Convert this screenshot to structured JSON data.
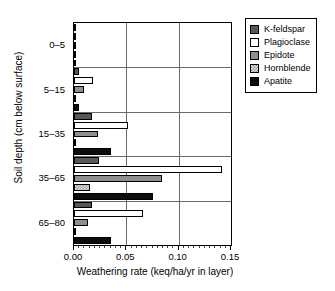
{
  "chart_data": {
    "type": "bar",
    "orientation": "horizontal",
    "title": "",
    "xlabel": "Weathering rate (keq/ha/yr in layer)",
    "ylabel": "Soil depth (cm below surface)",
    "xlim": [
      0.0,
      0.15
    ],
    "xticks": [
      0.0,
      0.05,
      0.1,
      0.15
    ],
    "xticklabels": [
      "0.00",
      "0.05",
      "0.10",
      "0.15"
    ],
    "categories": [
      "0–5",
      "5–15",
      "15–35",
      "35–65",
      "65–80"
    ],
    "grid": "vertical gridlines at 0.05 and 0.10; horizontal separators between depth groups",
    "legend_position": "upper right, outside axes",
    "series": [
      {
        "name": "K-feldspar",
        "color": "#585858",
        "values": [
          0.0015,
          0.0045,
          0.017,
          0.024,
          0.017
        ]
      },
      {
        "name": "Plagioclase",
        "color": "#ffffff",
        "values": [
          0.001,
          0.018,
          0.052,
          0.141,
          0.066
        ]
      },
      {
        "name": "Epidote",
        "color": "#8f8f8f",
        "values": [
          0.0005,
          0.01,
          0.023,
          0.084,
          0.013
        ]
      },
      {
        "name": "Hornblende",
        "color": "#d8d8d8",
        "values": [
          0.0002,
          0.0015,
          0.002,
          0.015,
          0.002
        ]
      },
      {
        "name": "Apatite",
        "color": "#0d0d0d",
        "values": [
          0.0008,
          0.005,
          0.035,
          0.075,
          0.035
        ]
      }
    ]
  },
  "legend": {
    "items": [
      {
        "label": "K-feldspar",
        "swatch": "swatch-k-feldspar"
      },
      {
        "label": "Plagioclase",
        "swatch": "swatch-plagioclase"
      },
      {
        "label": "Epidote",
        "swatch": "swatch-epidote"
      },
      {
        "label": "Hornblende",
        "swatch": "swatch-hornblende"
      },
      {
        "label": "Apatite",
        "swatch": "swatch-apatite"
      }
    ]
  }
}
